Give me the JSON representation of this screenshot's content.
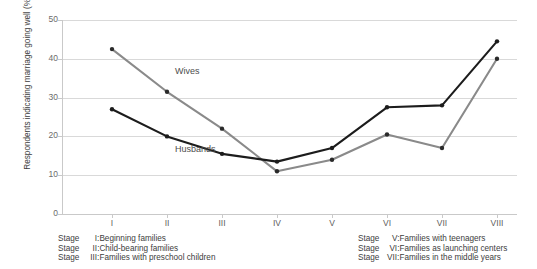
{
  "chart_data": {
    "type": "line",
    "title": "",
    "xlabel": "",
    "ylabel": "Respondents indicating marriage going well (%)",
    "categories": [
      "I",
      "II",
      "III",
      "IV",
      "V",
      "VI",
      "VII",
      "VIII"
    ],
    "ylim": [
      0,
      50
    ],
    "yticks": [
      0,
      10,
      20,
      30,
      40,
      50
    ],
    "grid": true,
    "legend_position": "inline-annotation",
    "series": [
      {
        "name": "Wives",
        "color": "#8a8a8a",
        "values": [
          42.5,
          31.5,
          22.0,
          11.0,
          14.0,
          20.5,
          17.0,
          40.0
        ]
      },
      {
        "name": "Husbands",
        "color": "#1c1c1c",
        "values": [
          27.0,
          20.0,
          15.5,
          13.5,
          17.0,
          27.5,
          28.0,
          44.5
        ]
      }
    ],
    "annotations": [
      {
        "text": "Wives",
        "category": "II",
        "value": 36.5
      },
      {
        "text": "Husbands",
        "category": "II",
        "value": 16.5
      }
    ]
  },
  "yaxis": {
    "title": "Respondents indicating marriage going well (%)",
    "ticks": [
      "50",
      "40",
      "30",
      "20",
      "10",
      "0"
    ]
  },
  "xaxis": {
    "ticks": [
      "I",
      "II",
      "III",
      "IV",
      "V",
      "VI",
      "VII",
      "VIII"
    ]
  },
  "legend": {
    "left": [
      {
        "stage": "Stage",
        "num": "I:",
        "text": "Beginning families"
      },
      {
        "stage": "Stage",
        "num": "II:",
        "text": "Child-bearing families"
      },
      {
        "stage": "Stage",
        "num": "III:",
        "text": "Families with preschool children"
      }
    ],
    "right": [
      {
        "stage": "Stage",
        "num": "V:",
        "text": "Families with teenagers"
      },
      {
        "stage": "Stage",
        "num": "VI:",
        "text": "Families as launching centers"
      },
      {
        "stage": "Stage",
        "num": "VII:",
        "text": "Families in the middle years"
      }
    ]
  },
  "colors": {
    "wives": "#8a8a8a",
    "husbands": "#1c1c1c",
    "grid": "#d9d9d9",
    "text": "#4a4a4a"
  }
}
